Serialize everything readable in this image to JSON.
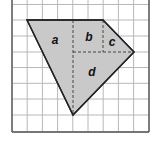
{
  "diagram": {
    "grid": {
      "cols_x": [
        12,
        27.2,
        42.4,
        57.6,
        72.8,
        88,
        103.2,
        118.4,
        133.6,
        149
      ],
      "rows_y": [
        4.5,
        20,
        36,
        52,
        67.5,
        83.3,
        99,
        115,
        132
      ],
      "line_color": "#b8b8b8",
      "border_color": "#555555"
    },
    "shape": {
      "vertices": [
        [
          27,
          20
        ],
        [
          103,
          20
        ],
        [
          134,
          52
        ],
        [
          73,
          115
        ]
      ],
      "fill": "#c9c9c9",
      "stroke": "#222222"
    },
    "dashed_lines": [
      {
        "x1": 73,
        "y1": 20,
        "x2": 73,
        "y2": 115
      },
      {
        "x1": 103,
        "y1": 20,
        "x2": 103,
        "y2": 52
      },
      {
        "x1": 73,
        "y1": 52,
        "x2": 134,
        "y2": 52
      }
    ],
    "labels": [
      {
        "text": "a",
        "x": 55,
        "y": 44
      },
      {
        "text": "b",
        "x": 89,
        "y": 41
      },
      {
        "text": "c",
        "x": 112,
        "y": 46
      },
      {
        "text": "d",
        "x": 92,
        "y": 76
      }
    ]
  }
}
